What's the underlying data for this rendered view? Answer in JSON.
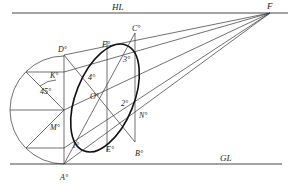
{
  "diagram": {
    "type": "perspective-construction",
    "lines": {
      "horizon": {
        "label": "HL"
      },
      "ground": {
        "label": "GL"
      }
    },
    "vanishing_point": {
      "label": "F"
    },
    "square_corners": [
      {
        "id": "A",
        "label": "A°"
      },
      {
        "id": "B",
        "label": "B°"
      },
      {
        "id": "C",
        "label": "C°"
      },
      {
        "id": "D",
        "label": "D°"
      }
    ],
    "midpoints": [
      {
        "id": "M",
        "label": "M°"
      },
      {
        "id": "N",
        "label": "N°"
      },
      {
        "id": "E",
        "label": "E°"
      },
      {
        "id": "Fm",
        "label": "F°"
      },
      {
        "id": "K",
        "label": "K°"
      }
    ],
    "center": {
      "label": "O°"
    },
    "diagonal_points": [
      {
        "id": "p1",
        "label": "1°"
      },
      {
        "id": "p2",
        "label": "2°"
      },
      {
        "id": "p3",
        "label": "3°"
      },
      {
        "id": "p4",
        "label": "4°"
      }
    ],
    "angle_annotation": {
      "label": "45°"
    }
  }
}
